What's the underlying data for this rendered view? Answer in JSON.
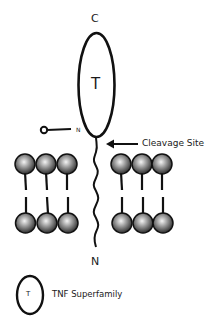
{
  "diagram": {
    "labels": {
      "c_terminus": "C",
      "domain_letter": "T",
      "n_small": "N",
      "cleavage_site": "Cleavage Site",
      "n_terminus": "N"
    },
    "legend": {
      "symbol_letter": "T",
      "label": "TNF Superfamily"
    },
    "colors": {
      "stroke": "#111111",
      "sphere_light": "#f2f2f2",
      "sphere_dark": "#3a3a3a",
      "background": "#ffffff"
    }
  }
}
